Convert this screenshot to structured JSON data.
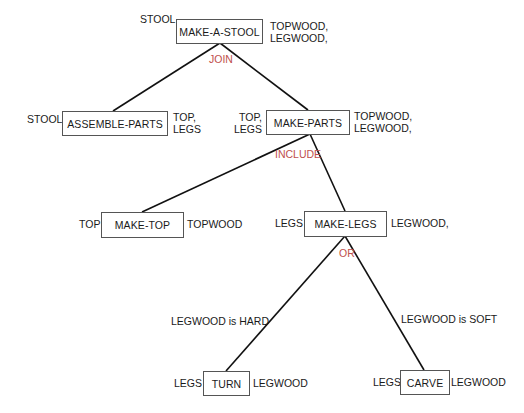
{
  "colors": {
    "relation_label": "#c0504d",
    "text": "#1a1a1a",
    "box_border": "#555555",
    "edge": "#111111"
  },
  "nodes": {
    "make_a_stool": {
      "label": "MAKE-A-STOOL",
      "output": "STOOL",
      "inputs": [
        "TOPWOOD,",
        "LEGWOOD,"
      ]
    },
    "assemble_parts": {
      "label": "ASSEMBLE-PARTS",
      "output": "STOOL",
      "inputs": [
        "TOP,",
        "LEGS"
      ]
    },
    "make_parts": {
      "label": "MAKE-PARTS",
      "outputs": [
        "TOP,",
        "LEGS"
      ],
      "inputs": [
        "TOPWOOD,",
        "LEGWOOD,"
      ]
    },
    "make_top": {
      "label": "MAKE-TOP",
      "output": "TOP",
      "input": "TOPWOOD"
    },
    "make_legs": {
      "label": "MAKE-LEGS",
      "output": "LEGS",
      "input": "LEGWOOD,"
    },
    "turn": {
      "label": "TURN",
      "output": "LEGS",
      "input": "LEGWOOD"
    },
    "carve": {
      "label": "CARVE",
      "output": "LEGS",
      "input": "LEGWOOD"
    }
  },
  "relations": {
    "join": "JOIN",
    "include": "INCLUDE",
    "or": "OR"
  },
  "conditions": {
    "hard": "LEGWOOD is HARD",
    "soft": "LEGWOOD is SOFT"
  }
}
